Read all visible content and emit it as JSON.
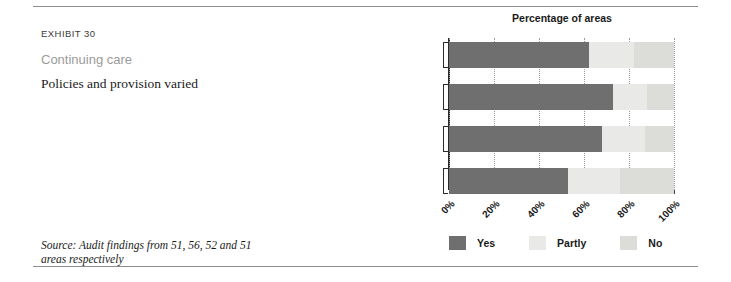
{
  "exhibit": {
    "number": "EXHIBIT 30",
    "title": "Continuing care",
    "subtitle": "Policies and provision varied"
  },
  "source_note": "Source: Audit findings from 51, 56, 52 and 51 areas respectively",
  "legend": {
    "items": [
      {
        "label": "Yes",
        "color": "#706f6f"
      },
      {
        "label": "Partly",
        "color": "#e9e9e7"
      },
      {
        "label": "No",
        "color": "#dcdcd9"
      }
    ]
  },
  "chart_data": {
    "type": "bar",
    "orientation": "horizontal",
    "stacked": true,
    "title": "Percentage of areas",
    "xlabel": "",
    "ylabel": "",
    "xlim": [
      0,
      100
    ],
    "grid": true,
    "legend_position": "bottom",
    "xticks": [
      0,
      20,
      40,
      60,
      80,
      100
    ],
    "xtick_labels": [
      "0%",
      "20%",
      "40%",
      "60%",
      "80%",
      "100%"
    ],
    "categories": [
      "Agreement between health and social services",
      "Funded for dementia",
      "Funded for functional illnesses",
      "Funded for challenging behaviour"
    ],
    "category_lines": [
      [
        "Agreement between health",
        "and social services"
      ],
      [
        "Funded for dementia"
      ],
      [
        "Funded for functional illnesses"
      ],
      [
        "Funded for challenging behaviour"
      ]
    ],
    "series": [
      {
        "name": "Yes",
        "color": "#706f6f",
        "values": [
          62,
          73,
          68,
          53
        ]
      },
      {
        "name": "Partly",
        "color": "#e9e9e7",
        "values": [
          20,
          15,
          19,
          23
        ]
      },
      {
        "name": "No",
        "color": "#dcdcd9",
        "values": [
          18,
          12,
          13,
          24
        ]
      }
    ]
  }
}
